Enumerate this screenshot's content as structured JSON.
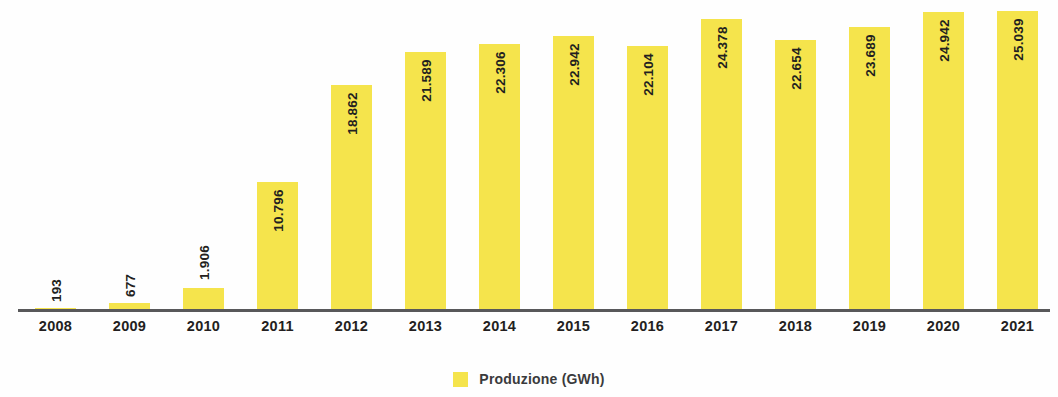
{
  "chart_data": {
    "type": "bar",
    "title": "",
    "subtitle": "",
    "xlabel": "",
    "ylabel": "",
    "categories": [
      "2008",
      "2009",
      "2010",
      "2011",
      "2012",
      "2013",
      "2014",
      "2015",
      "2016",
      "2017",
      "2018",
      "2019",
      "2020",
      "2021"
    ],
    "values": [
      193,
      677,
      1906,
      10796,
      18862,
      21589,
      22306,
      22942,
      22104,
      24378,
      22654,
      23689,
      24942,
      25039
    ],
    "value_labels": [
      "193",
      "677",
      "1.906",
      "10.796",
      "18.862",
      "21.589",
      "22.306",
      "22.942",
      "22.104",
      "24.378",
      "22.654",
      "23.689",
      "24.942",
      "25.039"
    ],
    "series": [
      {
        "name": "Produzione (GWh)",
        "values": [
          193,
          677,
          1906,
          10796,
          18862,
          21589,
          22306,
          22942,
          22104,
          24378,
          22654,
          23689,
          24942,
          25039
        ]
      }
    ],
    "ylim": [
      0,
      25039
    ],
    "grid": false,
    "legend_position": "bottom",
    "bar_color": "#f5e44c",
    "axis_color": "#58585a",
    "label_color": "#231f20"
  },
  "legend": {
    "entries": [
      {
        "label": "Produzione (GWh)",
        "color": "#f5e44c"
      }
    ]
  },
  "axis": {
    "x_tick_labels": [
      "2008",
      "2009",
      "2010",
      "2011",
      "2012",
      "2013",
      "2014",
      "2015",
      "2016",
      "2017",
      "2018",
      "2019",
      "2020",
      "2021"
    ]
  }
}
